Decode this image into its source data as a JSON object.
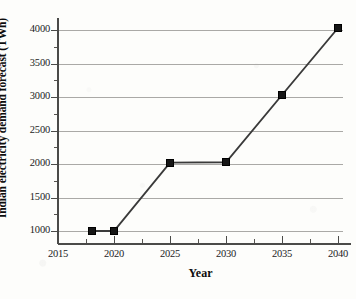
{
  "chart_data": {
    "type": "line",
    "title": "",
    "xlabel": "Year",
    "ylabel": "Indian electricity demand forecast (TWh)",
    "x": [
      2018,
      2020,
      2025,
      2030,
      2035,
      2040
    ],
    "values": [
      1000,
      1000,
      2020,
      2025,
      3030,
      4030
    ],
    "series": [
      {
        "name": "Indian electricity demand forecast",
        "values": [
          1000,
          1000,
          2020,
          2025,
          3030,
          4030
        ]
      }
    ],
    "xlim": [
      2015,
      2040.6
    ],
    "ylim": [
      800,
      4130
    ],
    "xticks": [
      2015,
      2020,
      2025,
      2030,
      2035,
      2040
    ],
    "xtick_labels": [
      "2015",
      "2020",
      "2025",
      "2030",
      "2035",
      "2040"
    ],
    "yticks": [
      1000,
      1500,
      2000,
      2500,
      3000,
      3500,
      4000
    ],
    "ytick_labels": [
      "1000",
      "1500",
      "2000",
      "2500",
      "3000",
      "3500",
      "4000"
    ],
    "grid": "horizontal",
    "legend": "none",
    "marker": "filled-square",
    "line_color": "#3a3a3a",
    "marker_color": "#161616",
    "grid_color": "#aaa9a6",
    "axis_color": "#4a4a48",
    "background_color": "#fdfdfb"
  }
}
